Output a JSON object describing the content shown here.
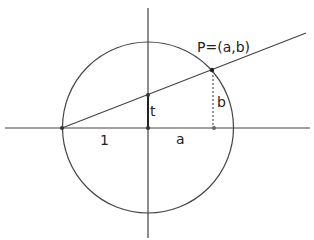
{
  "diagram": {
    "labels": {
      "point": "P=(a,b)",
      "t": "t",
      "b": "b",
      "one": "1",
      "a": "a"
    },
    "colors": {
      "stroke": "#444444",
      "background": "#ffffff"
    }
  }
}
